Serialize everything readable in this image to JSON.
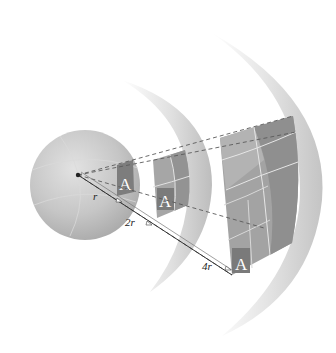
{
  "diagram": {
    "type": "inverse-square-law",
    "colors": {
      "sphere_fill": "#c8c8c8",
      "shell_fill": "#d9d9d9",
      "patch_dark": "#8c8c8c",
      "patch_mid": "#a6a6a6",
      "patch_light": "#b8b8b8",
      "dash": "#555555"
    },
    "source": {
      "label": "point source"
    },
    "patches": [
      {
        "letter": "A",
        "grid": "1x1"
      },
      {
        "letter": "A",
        "grid": "2x2"
      },
      {
        "letter": "A",
        "grid": "4x4"
      }
    ],
    "distances": [
      {
        "label": "r"
      },
      {
        "label": "2r"
      },
      {
        "label": "4r"
      }
    ]
  }
}
